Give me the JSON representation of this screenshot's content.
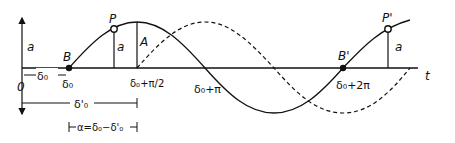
{
  "diagram": {
    "labels": {
      "amplitude_left": "a",
      "amplitude_P": "a",
      "amplitude_Pprime": "a",
      "point_B": "B",
      "point_P": "P",
      "point_A": "A",
      "point_Bprime": "B'",
      "point_Pprime": "P'",
      "origin": "0",
      "time_axis": "t",
      "delta0_span": "δ₀",
      "tick_delta0": "δ₀",
      "tick_delta0_pi2": "δ₀+π/2",
      "tick_delta0_pi": "δ₀+π",
      "tick_delta0_2pi": "δ₀+2π",
      "delta0prime_span": "δ'₀",
      "alpha_eq": "α=δ₀−δ'₀"
    },
    "curves": [
      {
        "name": "solid-sine",
        "style": "solid",
        "description": "sin wave starting at δ₀ (B), peak at δ₀+π/2, zero at δ₀+π, zero at δ₀+2π (B')"
      },
      {
        "name": "dashed-sine",
        "style": "dashed",
        "description": "sin wave shifted by π/2, starting at δ₀+π/2"
      }
    ],
    "colors": {
      "line": "#111111",
      "background": "#ffffff"
    }
  }
}
